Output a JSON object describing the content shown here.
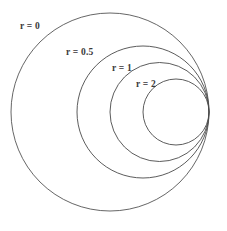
{
  "figure": {
    "background_color": "#ffffff",
    "stroke_color": "#4a4a4a",
    "label_color": "#3a3a3a",
    "width": 227,
    "height": 231
  },
  "labels": [
    {
      "text": "r = 0",
      "x": 20,
      "y": 22
    },
    {
      "text": "r = 0.5",
      "x": 66,
      "y": 48
    },
    {
      "text": "r = 1",
      "x": 112,
      "y": 64
    },
    {
      "text": "r = 2",
      "x": 136,
      "y": 80
    }
  ],
  "chart_data": {
    "type": "line",
    "title": "",
    "subtitle": "",
    "xlabel": "",
    "ylabel": "",
    "grid": false,
    "legend_position": "inline-annotations",
    "tangent_point": {
      "x": 209,
      "y": 112
    },
    "unit_radius": 99,
    "series": [
      {
        "name": "r = 0",
        "r_value": 0,
        "center_x": 110.0,
        "center_y": 112,
        "radius": 99.0
      },
      {
        "name": "r = 0.5",
        "r_value": 0.5,
        "center_x": 143.0,
        "center_y": 112,
        "radius": 66.0
      },
      {
        "name": "r = 1",
        "r_value": 1,
        "center_x": 159.5,
        "center_y": 112,
        "radius": 49.5
      },
      {
        "name": "r = 2",
        "r_value": 2,
        "center_x": 176.0,
        "center_y": 112,
        "radius": 33.0
      }
    ]
  }
}
